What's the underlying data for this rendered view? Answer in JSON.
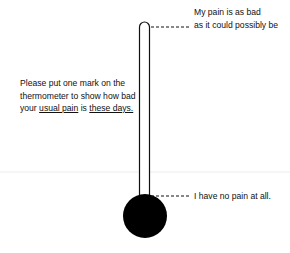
{
  "diagram": {
    "type": "pain-thermometer",
    "top_label": {
      "line1": "My pain is as bad",
      "line2": "as it could possibly be"
    },
    "bottom_label": "I have no pain at all.",
    "instruction": {
      "line1": "Please put one mark on the",
      "line2": "thermometer to show how bad",
      "line3_prefix": "your ",
      "line3_u1": "usual pain",
      "line3_mid": " is ",
      "line3_u2": "these days."
    },
    "colors": {
      "stroke": "#111111",
      "bulb": "#000000",
      "faint_line": "#e6e6e6"
    }
  }
}
